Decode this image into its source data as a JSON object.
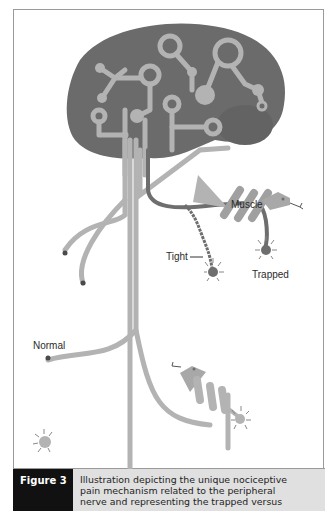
{
  "figure": {
    "labels": {
      "muscle": "Muscle",
      "tight": "Tight",
      "trapped": "Trapped",
      "normal": "Normal"
    },
    "caption": {
      "label": "Figure 3",
      "lines": [
        "Illustration depicting the unique nociceptive",
        "pain mechanism related to the peripheral",
        "nerve and representing the trapped versus"
      ]
    },
    "colors": {
      "brain": "#6b6b6b",
      "nerve_light": "#b3b3b3",
      "nerve_dark": "#6e6e6e",
      "caption_label_bg": "#111111",
      "caption_text_bg": "#e0e0e0",
      "frame": "#9a9a9a"
    }
  }
}
